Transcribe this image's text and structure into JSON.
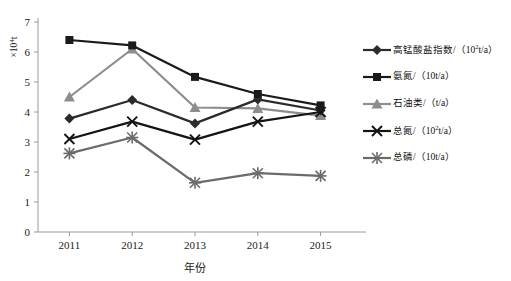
{
  "chart_data": {
    "type": "line",
    "title": "",
    "xlabel": "年份",
    "ylabel": "×10⁴t",
    "categories": [
      "2011",
      "2012",
      "2013",
      "2014",
      "2015"
    ],
    "ylim": [
      0,
      7
    ],
    "ytick_labels": [
      "0",
      "1",
      "2",
      "3",
      "4",
      "5",
      "6",
      "7"
    ],
    "grid": false,
    "legend_position": "right",
    "series": [
      {
        "name": "高锰酸盐指数/（10²t/a）",
        "marker": "diamond",
        "color": "#2b2b2b",
        "values": [
          3.78,
          4.4,
          3.62,
          4.42,
          4.05
        ]
      },
      {
        "name": "氨氮/（10t/a）",
        "marker": "square",
        "color": "#1a1a1a",
        "values": [
          6.4,
          6.22,
          5.17,
          4.6,
          4.22
        ]
      },
      {
        "name": "石油类/（t/a）",
        "marker": "triangle",
        "color": "#8d8d8d",
        "values": [
          4.5,
          6.1,
          4.15,
          4.12,
          3.88
        ]
      },
      {
        "name": "总氮/（10²t/a）",
        "marker": "cross",
        "color": "#141414",
        "values": [
          3.1,
          3.68,
          3.08,
          3.68,
          4.0
        ]
      },
      {
        "name": "总磷/（10t/a）",
        "marker": "asterisk",
        "color": "#6b6b6b",
        "values": [
          2.62,
          3.15,
          1.64,
          1.96,
          1.87
        ]
      }
    ]
  },
  "axis": {
    "y_unit_label": "×10⁴t",
    "x_title": "年份",
    "y_ticks": [
      "7",
      "6",
      "5",
      "4",
      "3",
      "2",
      "1",
      "0"
    ],
    "x_ticks": [
      "2011",
      "2012",
      "2013",
      "2014",
      "2015"
    ]
  },
  "legend": {
    "items": [
      {
        "label_html": "高锰酸盐指数/（10<sup>2</sup>t/a）",
        "marker": "diamond",
        "color": "#2b2b2b"
      },
      {
        "label_html": "氨氮/（10t/a）",
        "marker": "square",
        "color": "#1a1a1a"
      },
      {
        "label_html": "石油类/（t/a）",
        "marker": "triangle",
        "color": "#8d8d8d"
      },
      {
        "label_html": "总氮/（10<sup>2</sup>t/a）",
        "marker": "cross",
        "color": "#141414"
      },
      {
        "label_html": "总磷/（10t/a）",
        "marker": "asterisk",
        "color": "#6b6b6b"
      }
    ]
  }
}
